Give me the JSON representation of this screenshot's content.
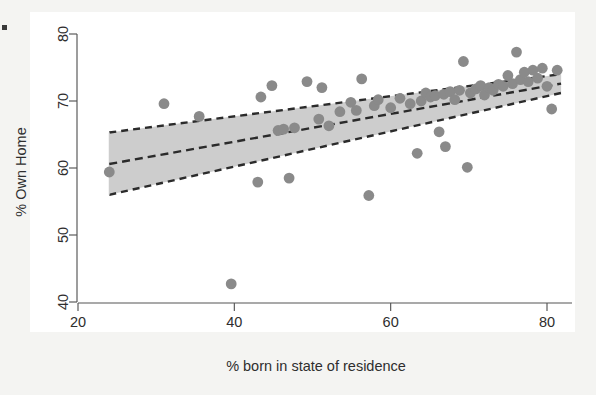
{
  "chart_data": {
    "type": "scatter",
    "title": "",
    "xlabel": "% born in state of residence",
    "ylabel": "% Own Home",
    "xlim": [
      16,
      84
    ],
    "ylim": [
      38,
      82
    ],
    "xticks": [
      20,
      40,
      60,
      80
    ],
    "xtick_labels": [
      "20",
      "40",
      "60",
      "80"
    ],
    "yticks": [
      40,
      50,
      60,
      70,
      80
    ],
    "ytick_labels": [
      "40",
      "50",
      "60",
      "70",
      "80"
    ],
    "grid": false,
    "legend": null,
    "point_color": "#8a8a8a",
    "band_color": "#c9c9c9",
    "line_color": "#2b2b2b",
    "annotations": [],
    "series": [
      {
        "name": "states",
        "marker": "circle",
        "points": [
          [
            24.0,
            59.4
          ],
          [
            31.0,
            69.6
          ],
          [
            35.5,
            67.7
          ],
          [
            39.6,
            42.7
          ],
          [
            43.0,
            57.9
          ],
          [
            43.4,
            70.6
          ],
          [
            44.8,
            72.3
          ],
          [
            45.6,
            65.6
          ],
          [
            46.3,
            65.8
          ],
          [
            47.0,
            58.5
          ],
          [
            47.7,
            66.0
          ],
          [
            49.3,
            72.9
          ],
          [
            50.8,
            67.3
          ],
          [
            51.2,
            72.0
          ],
          [
            52.1,
            66.3
          ],
          [
            53.5,
            68.4
          ],
          [
            54.9,
            69.8
          ],
          [
            55.6,
            68.6
          ],
          [
            56.3,
            73.3
          ],
          [
            57.2,
            55.9
          ],
          [
            57.9,
            69.3
          ],
          [
            58.4,
            70.2
          ],
          [
            60.0,
            69.0
          ],
          [
            61.2,
            70.4
          ],
          [
            62.5,
            69.6
          ],
          [
            63.4,
            62.2
          ],
          [
            63.9,
            70.0
          ],
          [
            64.5,
            71.2
          ],
          [
            65.1,
            70.6
          ],
          [
            65.7,
            70.8
          ],
          [
            66.2,
            65.4
          ],
          [
            66.8,
            71.0
          ],
          [
            67.0,
            63.2
          ],
          [
            67.6,
            71.4
          ],
          [
            68.2,
            70.2
          ],
          [
            68.8,
            71.6
          ],
          [
            69.3,
            75.9
          ],
          [
            69.8,
            60.1
          ],
          [
            70.2,
            71.2
          ],
          [
            70.9,
            71.8
          ],
          [
            71.5,
            72.3
          ],
          [
            72.0,
            70.9
          ],
          [
            72.6,
            72.0
          ],
          [
            73.1,
            71.6
          ],
          [
            73.8,
            72.5
          ],
          [
            74.4,
            72.2
          ],
          [
            75.0,
            73.8
          ],
          [
            75.6,
            72.6
          ],
          [
            76.1,
            77.3
          ],
          [
            76.6,
            73.2
          ],
          [
            77.1,
            74.3
          ],
          [
            77.6,
            72.9
          ],
          [
            78.2,
            74.6
          ],
          [
            78.8,
            73.4
          ],
          [
            79.4,
            74.9
          ],
          [
            80.0,
            72.2
          ],
          [
            80.6,
            68.8
          ],
          [
            81.3,
            74.6
          ]
        ]
      }
    ],
    "fit": {
      "name": "linear-fit",
      "style": "dashed",
      "x": [
        24.0,
        81.8
      ],
      "y": [
        60.6,
        72.6
      ]
    },
    "confidence_band": {
      "name": "confidence-interval",
      "style": "dashed-edges-shaded",
      "x": [
        24.0,
        81.8
      ],
      "upper": [
        65.3,
        74.0
      ],
      "lower": [
        56.0,
        71.2
      ]
    }
  },
  "axes": {
    "x_axis_name": "x-axis",
    "y_axis_name": "y-axis"
  }
}
